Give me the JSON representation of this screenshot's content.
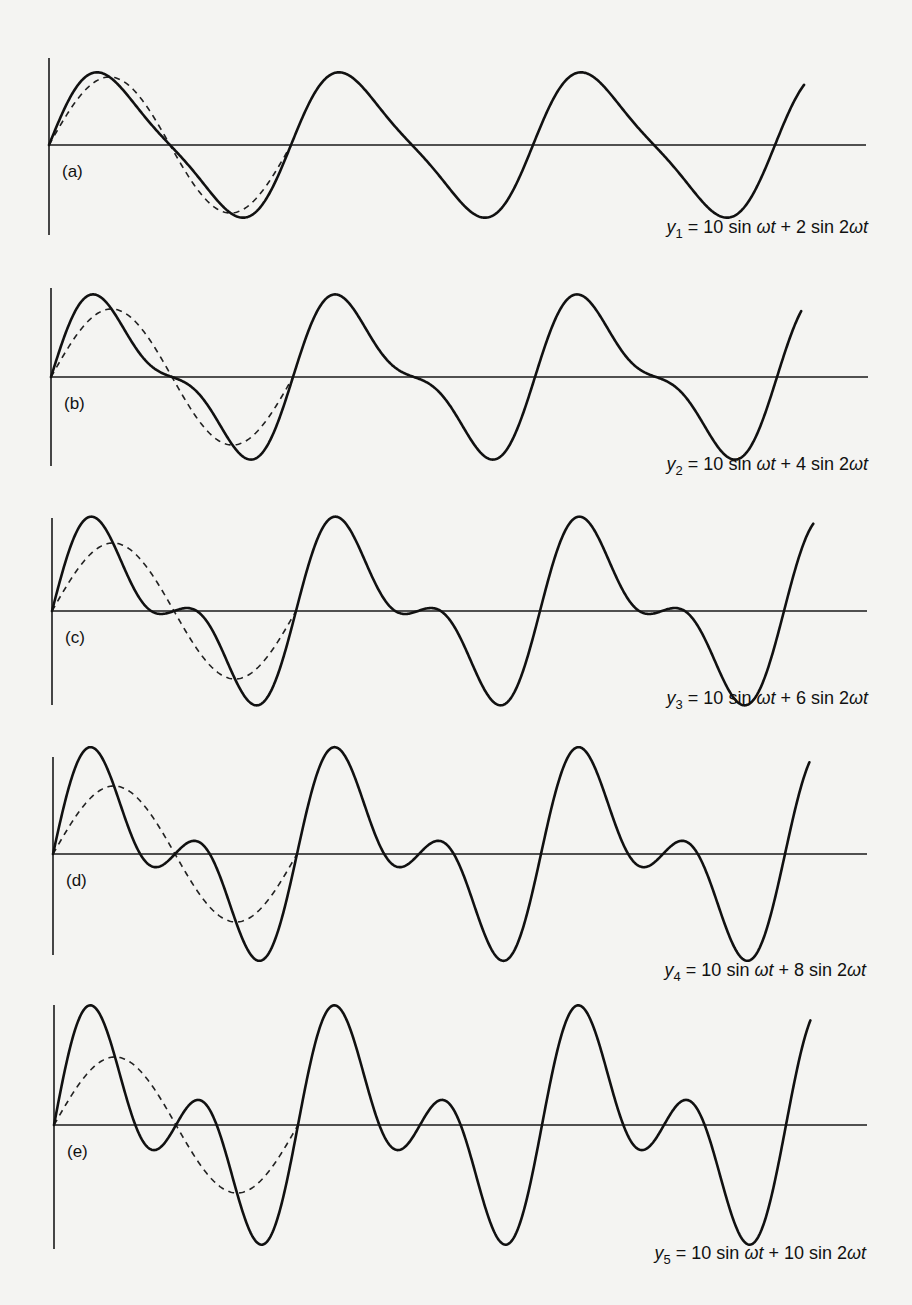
{
  "chart_data": {
    "type": "line",
    "title": "",
    "xlabel": "",
    "ylabel": "",
    "grid": false,
    "legend": "none",
    "x_unit": "omega_t_cycles",
    "x_range_cycles": [
      0,
      3.12
    ],
    "y_range": [
      -18,
      18
    ],
    "fundamental_dashed": {
      "style": "dashed",
      "expression": "10 sin ωt",
      "amplitude": 10,
      "cycles_shown": 1
    },
    "panels": [
      {
        "label": "(a)",
        "equation": {
          "var": "y",
          "sub": "1",
          "rest_parts": [
            "= 10 sin ",
            "ωt",
            " + 2 sin 2",
            "ωt"
          ]
        },
        "fundamental_amplitude": 10,
        "second_harmonic_amplitude": 2,
        "cycles": 3.12
      },
      {
        "label": "(b)",
        "equation": {
          "var": "y",
          "sub": "2",
          "rest_parts": [
            "= 10 sin ",
            "ωt",
            " + 4 sin 2",
            "ωt"
          ]
        },
        "fundamental_amplitude": 10,
        "second_harmonic_amplitude": 4,
        "cycles": 3.1
      },
      {
        "label": "(c)",
        "equation": {
          "var": "y",
          "sub": "3",
          "rest_parts": [
            "= 10 sin ",
            "ωt",
            " + 6 sin 2",
            "ωt"
          ]
        },
        "fundamental_amplitude": 10,
        "second_harmonic_amplitude": 6,
        "cycles": 3.12
      },
      {
        "label": "(d)",
        "equation": {
          "var": "y",
          "sub": "4",
          "rest_parts": [
            "= 10 sin ",
            "ωt",
            " + 8 sin 2",
            "ωt"
          ]
        },
        "fundamental_amplitude": 10,
        "second_harmonic_amplitude": 8,
        "cycles": 3.1
      },
      {
        "label": "(e)",
        "equation": {
          "var": "y",
          "sub": "5",
          "rest_parts": [
            "= 10 sin ",
            "ωt",
            " + 10 sin 2",
            "ωt"
          ]
        },
        "fundamental_amplitude": 10,
        "second_harmonic_amplitude": 10,
        "cycles": 3.1
      }
    ]
  }
}
